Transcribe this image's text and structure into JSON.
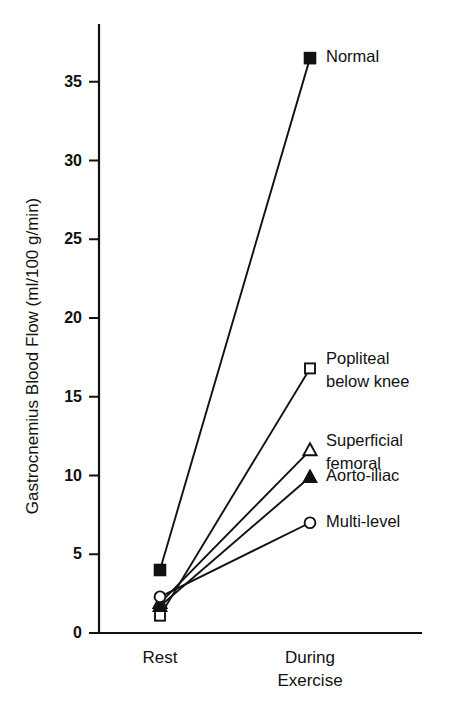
{
  "chart_data": {
    "type": "line",
    "title": "",
    "xlabel": "",
    "ylabel": "Gastrocnemius Blood Flow (ml/100 g/min)",
    "categories": [
      "Rest",
      "During Exercise"
    ],
    "category_labels": [
      {
        "line1": "Rest",
        "line2": ""
      },
      {
        "line1": "During",
        "line2": "Exercise"
      }
    ],
    "ylim": [
      0,
      38.5
    ],
    "yticks": [
      0,
      5,
      10,
      15,
      20,
      25,
      30,
      35
    ],
    "ytick_labels": [
      "0",
      "5",
      "10",
      "15",
      "20",
      "25",
      "30",
      "35"
    ],
    "grid": false,
    "legend_position": "right-of-endpoints",
    "series": [
      {
        "name": "Normal",
        "label_line1": "Normal",
        "label_line2": "",
        "marker": "filled-square",
        "color": "#111111",
        "values": [
          4.0,
          36.5
        ]
      },
      {
        "name": "Popliteal below knee",
        "label_line1": "Popliteal",
        "label_line2": "below knee",
        "marker": "open-square",
        "color": "#111111",
        "values": [
          1.1,
          16.8
        ]
      },
      {
        "name": "Superficial femoral",
        "label_line1": "Superficial",
        "label_line2": "femoral",
        "marker": "open-triangle",
        "color": "#111111",
        "values": [
          1.9,
          11.6
        ]
      },
      {
        "name": "Aorto-iliac",
        "label_line1": "Aorto-iliac",
        "label_line2": "",
        "marker": "filled-triangle",
        "color": "#111111",
        "values": [
          1.7,
          9.9
        ]
      },
      {
        "name": "Multi-level",
        "label_line1": "Multi-level",
        "label_line2": "",
        "marker": "open-circle",
        "color": "#111111",
        "values": [
          2.3,
          7.0
        ]
      }
    ]
  }
}
